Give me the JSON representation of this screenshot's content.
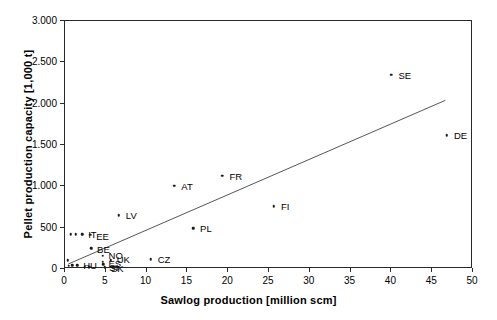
{
  "chart_data": {
    "type": "scatter",
    "title": "",
    "xlabel": "Sawlog production [million scm]",
    "ylabel": "Pellet production capacity [1,000 t]",
    "xlim": [
      0,
      50
    ],
    "ylim": [
      0,
      3000
    ],
    "xticks": [
      "0",
      "5",
      "10",
      "15",
      "20",
      "25",
      "30",
      "35",
      "40",
      "45",
      "50"
    ],
    "xtick_values": [
      0,
      5,
      10,
      15,
      20,
      25,
      30,
      35,
      40,
      45,
      50
    ],
    "yticks": [
      "0",
      "500",
      "1.000",
      "1.500",
      "2.000",
      "2.500",
      "3.000"
    ],
    "ytick_values": [
      0,
      500,
      1000,
      1500,
      2000,
      2500,
      3000
    ],
    "grid": false,
    "legend": "none",
    "marker_color": "#1a1a1a",
    "line_color": "#555555",
    "frame_color": "#2a2a2a",
    "points": [
      {
        "label": "SE",
        "x": 40.0,
        "y": 2350,
        "lx": 7,
        "ly": 0
      },
      {
        "label": "DE",
        "x": 46.8,
        "y": 1620,
        "lx": 7,
        "ly": 0
      },
      {
        "label": "FR",
        "x": 19.3,
        "y": 1130,
        "lx": 7,
        "ly": 0
      },
      {
        "label": "AT",
        "x": 13.4,
        "y": 1010,
        "lx": 7,
        "ly": 0
      },
      {
        "label": "FI",
        "x": 25.6,
        "y": 760,
        "lx": 7,
        "ly": 0
      },
      {
        "label": "LV",
        "x": 6.6,
        "y": 650,
        "lx": 7,
        "ly": 0
      },
      {
        "label": "PL",
        "x": 15.7,
        "y": 490,
        "lx": 7,
        "ly": 0
      },
      {
        "label": "IT",
        "x": 2.1,
        "y": 420,
        "lx": 6,
        "ly": 0
      },
      {
        "label": "EE",
        "x": 3.1,
        "y": 415,
        "lx": 6,
        "ly": 1
      },
      {
        "label": "",
        "x": 0.7,
        "y": 420,
        "lx": 0,
        "ly": 0
      },
      {
        "label": "",
        "x": 1.3,
        "y": 420,
        "lx": 0,
        "ly": 0
      },
      {
        "label": "BE",
        "x": 3.2,
        "y": 250,
        "lx": 6,
        "ly": 1
      },
      {
        "label": "NO",
        "x": 4.6,
        "y": 160,
        "lx": 6,
        "ly": -1
      },
      {
        "label": "CZ",
        "x": 10.5,
        "y": 120,
        "lx": 7,
        "ly": 0
      },
      {
        "label": "ES",
        "x": 4.6,
        "y": 85,
        "lx": 6,
        "ly": 1
      },
      {
        "label": "UK",
        "x": 5.6,
        "y": 105,
        "lx": 6,
        "ly": -1
      },
      {
        "label": "SI",
        "x": 4.7,
        "y": 55,
        "lx": 6,
        "ly": 3
      },
      {
        "label": "SK",
        "x": 4.9,
        "y": 20,
        "lx": 6,
        "ly": 1
      },
      {
        "label": "HU",
        "x": 1.5,
        "y": 45,
        "lx": 6,
        "ly": 0
      },
      {
        "label": "",
        "x": 0.35,
        "y": 105,
        "lx": 0,
        "ly": 0
      },
      {
        "label": "",
        "x": 0.45,
        "y": 40,
        "lx": 0,
        "ly": 0
      },
      {
        "label": "",
        "x": 0.9,
        "y": 45,
        "lx": 0,
        "ly": 0
      },
      {
        "label": "",
        "x": 2.4,
        "y": 30,
        "lx": 0,
        "ly": 0
      },
      {
        "label": "",
        "x": 3.0,
        "y": 25,
        "lx": 0,
        "ly": 0
      }
    ],
    "trendline": {
      "x0": 0.4,
      "y0": 60,
      "x1": 46.6,
      "y1": 2040
    }
  }
}
